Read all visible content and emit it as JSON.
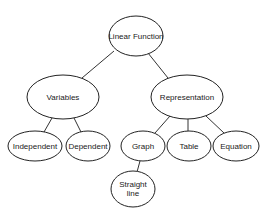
{
  "diagram": {
    "type": "concept-map",
    "nodes": [
      {
        "id": "linear-function",
        "label": "Linear Function",
        "lines": [
          "Linear Function"
        ],
        "cx": 136,
        "cy": 36,
        "rx": 27,
        "ry": 20
      },
      {
        "id": "variables",
        "label": "Variables",
        "lines": [
          "Variables"
        ],
        "cx": 63,
        "cy": 97,
        "rx": 36,
        "ry": 22
      },
      {
        "id": "representation",
        "label": "Representation",
        "lines": [
          "Representation"
        ],
        "cx": 187,
        "cy": 97,
        "rx": 36,
        "ry": 22
      },
      {
        "id": "independent",
        "label": "Independent",
        "lines": [
          "Independent"
        ],
        "cx": 35,
        "cy": 146,
        "rx": 27,
        "ry": 15
      },
      {
        "id": "dependent",
        "label": "Dependent",
        "lines": [
          "Dependent"
        ],
        "cx": 88,
        "cy": 146,
        "rx": 22,
        "ry": 15
      },
      {
        "id": "graph",
        "label": "Graph",
        "lines": [
          "Graph"
        ],
        "cx": 143,
        "cy": 146,
        "rx": 22,
        "ry": 15
      },
      {
        "id": "table",
        "label": "Table",
        "lines": [
          "Table"
        ],
        "cx": 189,
        "cy": 146,
        "rx": 22,
        "ry": 15
      },
      {
        "id": "equation",
        "label": "Equation",
        "lines": [
          "Equation"
        ],
        "cx": 236,
        "cy": 146,
        "rx": 23,
        "ry": 15
      },
      {
        "id": "straight-line",
        "label": "Straight line",
        "lines": [
          "Straight",
          "line"
        ],
        "cx": 133,
        "cy": 189,
        "rx": 22,
        "ry": 18
      }
    ],
    "edges": [
      {
        "from": "linear-function",
        "to": "variables",
        "x1": 114,
        "y1": 51,
        "x2": 82,
        "y2": 78
      },
      {
        "from": "linear-function",
        "to": "representation",
        "x1": 148,
        "y1": 53,
        "x2": 168,
        "y2": 78
      },
      {
        "from": "variables",
        "to": "independent",
        "x1": 52,
        "y1": 118,
        "x2": 44,
        "y2": 132
      },
      {
        "from": "variables",
        "to": "dependent",
        "x1": 74,
        "y1": 118,
        "x2": 81,
        "y2": 132
      },
      {
        "from": "representation",
        "to": "graph",
        "x1": 170,
        "y1": 116,
        "x2": 155,
        "y2": 133
      },
      {
        "from": "representation",
        "to": "table",
        "x1": 188,
        "y1": 119,
        "x2": 188,
        "y2": 131
      },
      {
        "from": "representation",
        "to": "equation",
        "x1": 206,
        "y1": 116,
        "x2": 224,
        "y2": 133
      },
      {
        "from": "graph",
        "to": "straight-line",
        "x1": 140,
        "y1": 161,
        "x2": 137,
        "y2": 172
      }
    ]
  }
}
